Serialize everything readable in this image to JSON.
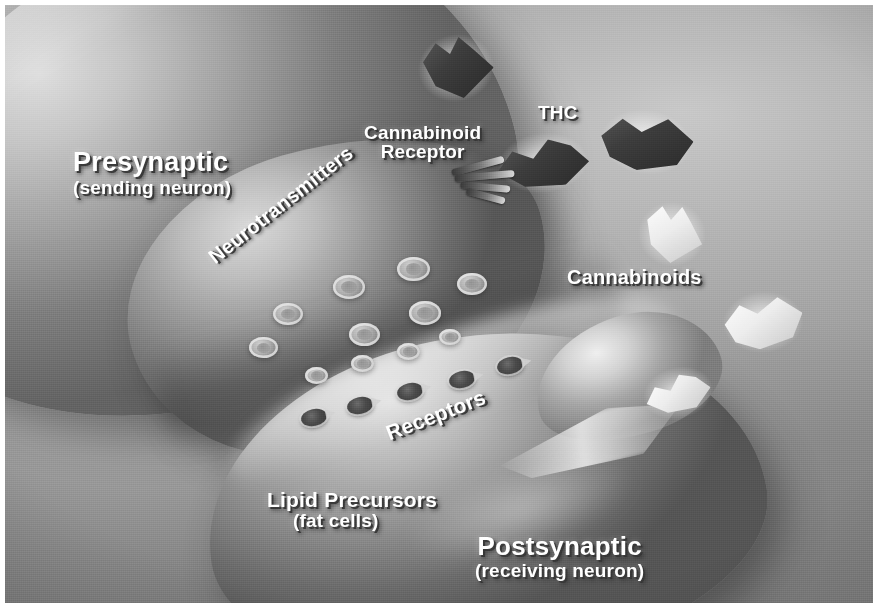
{
  "illustration": {
    "title": "Cannabinoid action at the synapse",
    "palette": {
      "background": "#8e8e8e",
      "label_text": "#ffffff",
      "label_shadow": "#373737",
      "thc_molecule": "#2a2a2a",
      "cannabinoid_molecule": "#f2f2f2",
      "receptor": "#3a3a3a",
      "plate_margin": "#ffffff"
    }
  },
  "labels": {
    "presynaptic": {
      "main": "Presynaptic",
      "sub": "(sending neuron)"
    },
    "cannabinoid_receptor": {
      "main": "Cannabinoid",
      "sub": "Receptor"
    },
    "thc": "THC",
    "neurotransmitters": "Neurotransmitters",
    "cannabinoids": "Cannabinoids",
    "receptors": "Receptors",
    "lipid_precursors": {
      "main": "Lipid Precursors",
      "sub": "(fat cells)"
    },
    "postsynaptic": {
      "main": "Postsynaptic",
      "sub": "(receiving neuron)"
    }
  },
  "structures": {
    "vesicles": [
      {
        "x": 268,
        "y": 298,
        "d": 30
      },
      {
        "x": 328,
        "y": 270,
        "d": 32
      },
      {
        "x": 392,
        "y": 252,
        "d": 33
      },
      {
        "x": 344,
        "y": 318,
        "d": 31
      },
      {
        "x": 404,
        "y": 296,
        "d": 32
      },
      {
        "x": 244,
        "y": 332,
        "d": 29
      },
      {
        "x": 452,
        "y": 268,
        "d": 30
      },
      {
        "x": 300,
        "y": 362,
        "d": 23
      },
      {
        "x": 346,
        "y": 350,
        "d": 23
      },
      {
        "x": 392,
        "y": 338,
        "d": 23
      },
      {
        "x": 434,
        "y": 324,
        "d": 22
      }
    ],
    "receptors": [
      {
        "x": 296,
        "y": 404
      },
      {
        "x": 342,
        "y": 392
      },
      {
        "x": 392,
        "y": 378
      },
      {
        "x": 444,
        "y": 366
      },
      {
        "x": 492,
        "y": 352
      }
    ],
    "molecules": [
      {
        "name": "thc-molecule-top",
        "kind": "dark",
        "shape": "shape-a",
        "x": 414,
        "y": 32,
        "w": 74,
        "h": 62,
        "rot": -12
      },
      {
        "name": "thc-molecule-docking",
        "kind": "dark",
        "shape": "shape-b",
        "x": 492,
        "y": 132,
        "w": 92,
        "h": 52,
        "rot": -6
      },
      {
        "name": "thc-molecule-right",
        "kind": "dark",
        "shape": "shape-c",
        "x": 594,
        "y": 108,
        "w": 94,
        "h": 58,
        "rot": 8
      },
      {
        "name": "cannabinoid-upper",
        "kind": "light",
        "shape": "shape-a",
        "x": 636,
        "y": 200,
        "w": 62,
        "h": 58,
        "rot": 6
      },
      {
        "name": "cannabinoid-lower",
        "kind": "light",
        "shape": "shape-c",
        "x": 718,
        "y": 290,
        "w": 80,
        "h": 54,
        "rot": -4
      },
      {
        "name": "cannabinoid-bound",
        "kind": "light",
        "shape": "shape-b",
        "x": 640,
        "y": 368,
        "w": 66,
        "h": 40,
        "rot": -14
      }
    ]
  }
}
